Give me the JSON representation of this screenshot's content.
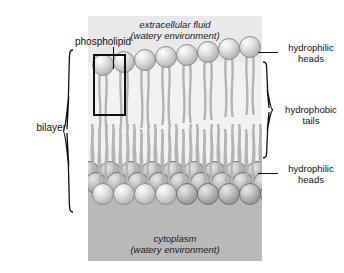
{
  "top_clipped_text": "",
  "diagram": {
    "regions": {
      "extracellular": {
        "line1": "extracellular fluid",
        "line2": "(watery environment)"
      },
      "cytoplasm": {
        "line1": "cytoplasm",
        "line2": "(watery environment)"
      }
    },
    "labels": {
      "phospholipid": "phospholipid",
      "bilayer": "bilayer",
      "hydrophilic_heads_top": {
        "line1": "hydrophilic",
        "line2": "heads"
      },
      "hydrophobic_tails": {
        "line1": "hydrophobic",
        "line2": "tails"
      },
      "hydrophilic_heads_bottom": {
        "line1": "hydrophilic",
        "line2": "heads"
      }
    },
    "structure": {
      "upper_leaflet_head_count": 8,
      "lower_leaflet_rows": 3,
      "lower_leaflet_head_count_front": 8,
      "highlighted_molecule_index": 1
    },
    "colors": {
      "extracellular_bg": "#e9e9e9",
      "membrane_bg": "#f2f2f2",
      "cytoplasm_bg": "#b9b9b9",
      "head_light": "#e2e2e2",
      "head_dark": "#9d9d9d",
      "tail_stroke": "#b4b4b4",
      "label_text": "#111111",
      "highlight_box": "#111111"
    }
  }
}
